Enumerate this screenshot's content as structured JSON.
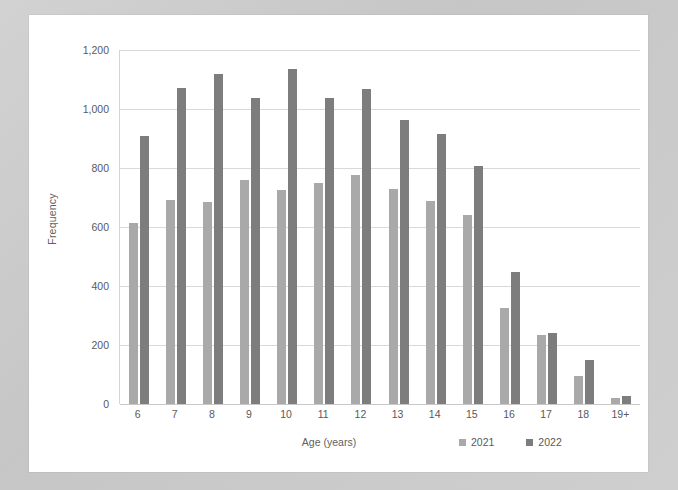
{
  "chart_data": {
    "type": "bar",
    "title": "",
    "xlabel": "Age (years)",
    "ylabel": "Frequency",
    "categories": [
      "6",
      "7",
      "8",
      "9",
      "10",
      "11",
      "12",
      "13",
      "14",
      "15",
      "16",
      "17",
      "18",
      "19+"
    ],
    "series": [
      {
        "name": "2021",
        "color": "#a9a9a9",
        "values": [
          613,
          693,
          686,
          758,
          727,
          750,
          775,
          728,
          688,
          640,
          327,
          235,
          96,
          22
        ]
      },
      {
        "name": "2022",
        "color": "#7d7d7d",
        "values": [
          908,
          1070,
          1120,
          1037,
          1135,
          1038,
          1068,
          964,
          915,
          806,
          447,
          241,
          150,
          28
        ]
      }
    ],
    "ylim": [
      0,
      1200
    ],
    "y_ticks": [
      "0",
      "200",
      "400",
      "600",
      "800",
      "1,000",
      "1,200"
    ],
    "y_tick_values": [
      0,
      200,
      400,
      600,
      800,
      1000,
      1200
    ],
    "grid": true,
    "legend_position": "bottom-right",
    "legend_entries": [
      "2021",
      "2022"
    ]
  },
  "colors": {
    "series_2021": "#a9a9a9",
    "series_2022": "#7d7d7d",
    "gridline": "#d9d9d9",
    "axis": "#d4d4d4",
    "text": "#595959",
    "chart_background": "#ffffff",
    "page_background": "#cccccc"
  }
}
